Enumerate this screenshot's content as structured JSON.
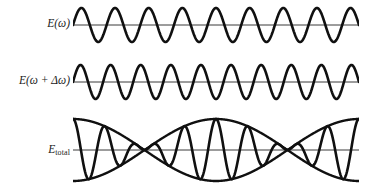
{
  "figure": {
    "name": "wave-beats-figure",
    "background_color": "#ffffff",
    "stroke_color": "#101010",
    "axis_color": "#3a3a3a",
    "width": 367,
    "height": 188
  },
  "rows": [
    {
      "id": "wave-omega",
      "label_html": "E(ω)",
      "label_text": "E(ω)"
    },
    {
      "id": "wave-omega-delta",
      "label_html": "E(ω + Δω)",
      "label_text": "E(ω + Δω)"
    },
    {
      "id": "wave-total",
      "label_main": "E",
      "label_sub": "total",
      "label_text": "E_total"
    }
  ],
  "chart_data": {
    "type": "line",
    "title": "",
    "xlabel": "",
    "ylabel": "",
    "grid": false,
    "legend": "none",
    "x_range": [
      0,
      1
    ],
    "panels": [
      {
        "name": "E(ω)",
        "curve": "sine",
        "cycles": 8.5,
        "amplitude": 1.0,
        "phase_deg": 0,
        "ylim": [
          -1,
          1
        ],
        "plot_box": {
          "x": 73,
          "y": 6,
          "width": 285,
          "height": 38
        },
        "baseline_y": 25
      },
      {
        "name": "E(ω + Δω)",
        "curve": "sine",
        "cycles": 9.5,
        "amplitude": 1.0,
        "phase_deg": 0,
        "ylim": [
          -1,
          1
        ],
        "plot_box": {
          "x": 73,
          "y": 63,
          "width": 285,
          "height": 38
        },
        "baseline_y": 82
      },
      {
        "name": "E_total",
        "curve": "beat",
        "carrier_cycles": 9.0,
        "envelope_cycles": 1.0,
        "envelope_phase_deg": 0,
        "amplitude": 2.0,
        "ylim": [
          -2,
          2
        ],
        "plot_box": {
          "x": 73,
          "y": 118,
          "width": 285,
          "height": 64
        },
        "baseline_y": 150,
        "nodes_x": [
          143,
          287
        ],
        "antinodes_x": [
          73,
          215,
          357
        ]
      }
    ]
  }
}
